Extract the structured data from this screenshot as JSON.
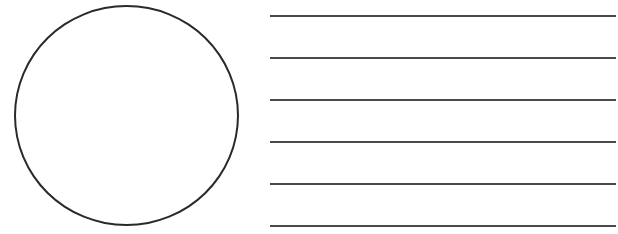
{
  "figure": {
    "shapes": {
      "circle": {
        "type": "outline-circle",
        "stroke_color": "#2a2a2a"
      },
      "lines": {
        "count": 6,
        "stroke_color": "#4a4a4a",
        "positions_y": [
          16,
          58,
          100,
          142,
          184,
          226
        ]
      }
    }
  }
}
